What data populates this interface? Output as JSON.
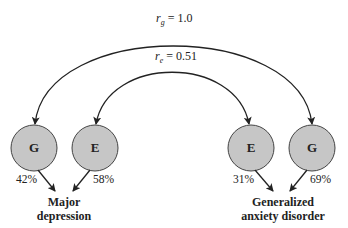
{
  "correlations": {
    "genetic": {
      "symbol": "r",
      "subscript": "g",
      "value": "= 1.0"
    },
    "environmental": {
      "symbol": "r",
      "subscript": "e",
      "value": "= 0.51"
    }
  },
  "nodes": [
    {
      "id": "G-left",
      "label": "G",
      "percent": "42%",
      "outcome": "depression"
    },
    {
      "id": "E-left",
      "label": "E",
      "percent": "58%",
      "outcome": "depression"
    },
    {
      "id": "E-right",
      "label": "E",
      "percent": "31%",
      "outcome": "anxiety"
    },
    {
      "id": "G-right",
      "label": "G",
      "percent": "69%",
      "outcome": "anxiety"
    }
  ],
  "outcomes": {
    "depression": {
      "line1": "Major",
      "line2": "depression"
    },
    "anxiety": {
      "line1": "Generalized",
      "line2": "anxiety disorder"
    }
  },
  "colors": {
    "node_fill": "#c6c6c6",
    "stroke": "#222222"
  }
}
